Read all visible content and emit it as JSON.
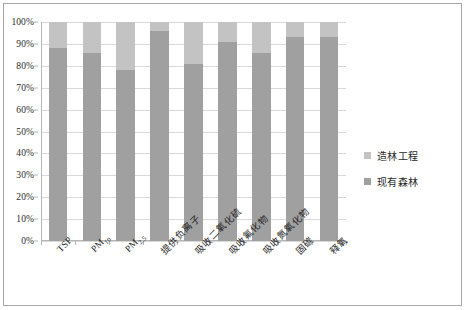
{
  "chart_data": {
    "type": "bar",
    "subtype": "stacked-percent",
    "title": "",
    "xlabel": "",
    "ylabel": "",
    "ylim": [
      0,
      100
    ],
    "y_tick_labels": [
      "100%",
      "90%",
      "80%",
      "70%",
      "60%",
      "50%",
      "40%",
      "30%",
      "20%",
      "10%",
      "0%"
    ],
    "y_tick_values": [
      100,
      90,
      80,
      70,
      60,
      50,
      40,
      30,
      20,
      10,
      0
    ],
    "grid": true,
    "legend_position": "right",
    "categories": [
      "TSP",
      "PM10",
      "PM2.5",
      "提供负离子",
      "吸收二氧化硫",
      "吸收氟化物",
      "吸收氮氧化物",
      "固碳",
      "释氧"
    ],
    "category_labels_html": [
      {
        "main": "TSP",
        "sub": ""
      },
      {
        "main": "PM",
        "sub": "10"
      },
      {
        "main": "PM",
        "sub": "2.5"
      },
      {
        "main": "提供负离子",
        "sub": ""
      },
      {
        "main": "吸收二氧化硫",
        "sub": ""
      },
      {
        "main": "吸收氟化物",
        "sub": ""
      },
      {
        "main": "吸收氮氧化物",
        "sub": ""
      },
      {
        "main": "固碳",
        "sub": ""
      },
      {
        "main": "释氧",
        "sub": ""
      }
    ],
    "series": [
      {
        "name": "现有森林",
        "color": "#a0a0a0",
        "values": [
          88,
          86,
          78,
          96,
          81,
          91,
          86,
          93,
          93
        ]
      },
      {
        "name": "造林工程",
        "color": "#c3c3c3",
        "values": [
          12,
          14,
          22,
          4,
          19,
          9,
          14,
          7,
          7
        ]
      }
    ]
  },
  "legend": {
    "items": [
      {
        "label": "造林工程",
        "color": "#c3c3c3"
      },
      {
        "label": "现有森林",
        "color": "#a0a0a0"
      }
    ]
  }
}
